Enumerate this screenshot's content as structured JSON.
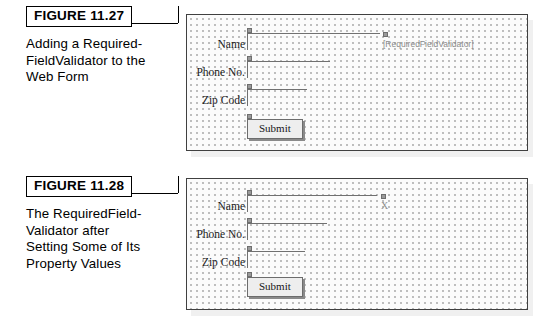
{
  "page": {
    "background": "#ffffff",
    "figure_rule_color": "#000000",
    "panel_border_color": "#404040",
    "panel_background": "#fbfbfb",
    "panel_dot_color": "#b9b9b9",
    "validator_text_color": "#8b8b8b"
  },
  "figures": [
    {
      "badge": "FIGURE 11.27",
      "caption_lines": [
        "Adding a Required-",
        "FieldValidator to the",
        "Web Form"
      ],
      "form": {
        "rows": [
          {
            "label": "Name",
            "field_width": 133
          },
          {
            "label": "Phone No.",
            "field_width": 83
          },
          {
            "label": "Zip Code",
            "field_width": 60
          }
        ],
        "submit_label": "Submit",
        "validator_label": "[RequiredFieldValidator]",
        "validator_x": ""
      }
    },
    {
      "badge": "FIGURE 11.28",
      "caption_lines": [
        "The RequiredField-",
        "Validator after",
        "Setting Some of Its",
        "Property Values"
      ],
      "form": {
        "rows": [
          {
            "label": "Name",
            "field_width": 130
          },
          {
            "label": "Phone No.",
            "field_width": 80
          },
          {
            "label": "Zip Code",
            "field_width": 58
          }
        ],
        "submit_label": "Submit",
        "validator_label": "",
        "validator_x": "X"
      }
    }
  ]
}
